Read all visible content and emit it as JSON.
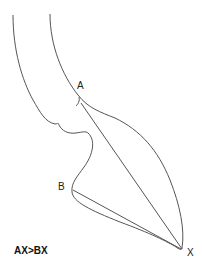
{
  "diagram": {
    "points": {
      "a": "A",
      "b": "B",
      "x": "X"
    },
    "caption": "AX>BX",
    "stroke_color": "#555555"
  }
}
